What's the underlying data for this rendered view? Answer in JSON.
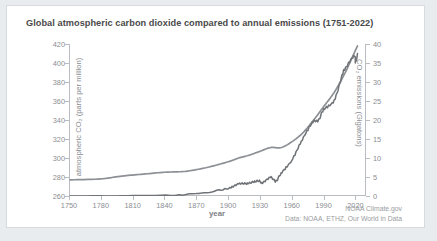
{
  "chart_data": {
    "type": "line",
    "title": "Global atmospheric carbon dioxide compared to annual emissions (1751-2022)",
    "xlabel": "year",
    "ylabel": "atmospheric CO₂ (parts per million)",
    "ylabel_right": "CO₂ emissions (Gigatons)",
    "xlim": [
      1750,
      2030
    ],
    "ylim": [
      260,
      420
    ],
    "ylim_right": [
      0,
      40
    ],
    "grid": false,
    "legend_position": "none",
    "xticks": [
      1750,
      1780,
      1810,
      1840,
      1870,
      1900,
      1930,
      1960,
      1990,
      2020
    ],
    "yticks": [
      260,
      280,
      300,
      320,
      340,
      360,
      380,
      400,
      420
    ],
    "yticks_right": [
      0,
      5,
      10,
      15,
      20,
      25,
      30,
      35,
      40
    ],
    "colors": {
      "co2_line": "#8d9095",
      "emissions_line": "#6f7276",
      "axis": "#b9bcc0",
      "text": "#8b8e93"
    },
    "series": [
      {
        "name": "atmospheric CO2 (ppm)",
        "axis": "left",
        "x": [
          1751,
          1780,
          1800,
          1820,
          1840,
          1860,
          1880,
          1900,
          1910,
          1920,
          1930,
          1940,
          1950,
          1960,
          1970,
          1980,
          1990,
          2000,
          2010,
          2015,
          2022
        ],
        "values": [
          277,
          278,
          281,
          283,
          285,
          286,
          290,
          296,
          300,
          303,
          307,
          311,
          311,
          317,
          326,
          339,
          354,
          369,
          389,
          401,
          418
        ]
      },
      {
        "name": "CO2 emissions (Gigatons)",
        "axis": "right",
        "x": [
          1751,
          1800,
          1850,
          1880,
          1900,
          1910,
          1918,
          1925,
          1930,
          1932,
          1940,
          1945,
          1950,
          1960,
          1970,
          1980,
          1985,
          1990,
          2000,
          2008,
          2010,
          2019,
          2020,
          2022
        ],
        "values": [
          0.01,
          0.03,
          0.2,
          1.0,
          2.0,
          3.2,
          3.3,
          3.8,
          4.0,
          3.4,
          4.9,
          3.9,
          6.0,
          9.4,
          14.9,
          19.5,
          19.8,
          22.7,
          25.2,
          32.2,
          33.3,
          37.0,
          35.0,
          37.5
        ]
      }
    ],
    "credit_line1": "NOAA Climate.gov",
    "credit_line2": "Data: NOAA, ETHZ, Our World in Data"
  }
}
